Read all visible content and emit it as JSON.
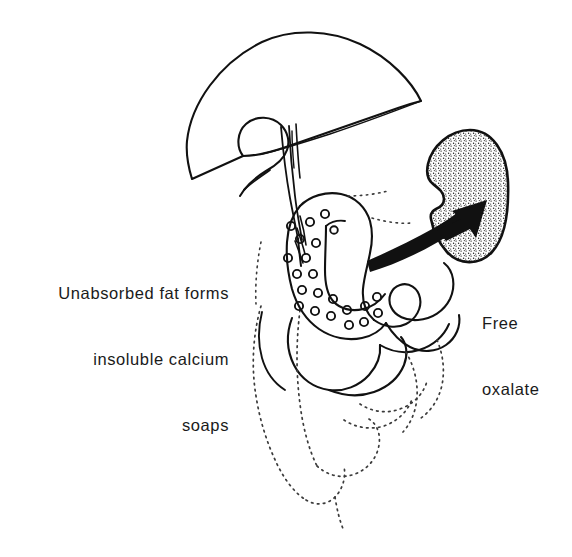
{
  "figure": {
    "domain": "diagram",
    "background_color": "#ffffff",
    "ink_color": "#111111",
    "width": 572,
    "height": 557
  },
  "labels": {
    "left": {
      "name": "unabsorbed-fat-label",
      "align": "right",
      "lines": [
        "Unabsorbed fat forms",
        "insoluble calcium",
        "soaps"
      ]
    },
    "right": {
      "name": "free-oxalate-label",
      "align": "left",
      "lines": [
        "Free",
        "oxalate"
      ]
    }
  },
  "anatomy": [
    {
      "name": "liver",
      "style": "outline",
      "description": "large dome / fan shaped organ occupying the upper portion"
    },
    {
      "name": "gallbladder",
      "style": "outline",
      "description": "small pear shaped sac beneath the liver"
    },
    {
      "name": "bile-duct",
      "style": "outline",
      "description": "ducts descending from gallbladder and liver toward the duodenum"
    },
    {
      "name": "duodenum",
      "style": "outline",
      "description": "C-shaped loop containing stippled fat globules"
    },
    {
      "name": "fat-globules",
      "style": "open-circles",
      "description": "small open circles inside the duodenal loop representing insoluble calcium soaps",
      "count": 22
    },
    {
      "name": "jejunum-loops",
      "style": "outline",
      "description": "serpentine small bowel loops below and right of the duodenum"
    },
    {
      "name": "small-bowel-faded",
      "style": "dotted-outline",
      "description": "faded dotted outlines of further bowel loops trailing to the bottom"
    },
    {
      "name": "kidney",
      "style": "stippled-fill",
      "description": "bean shaped organ at upper right filled with fine stipple texture"
    },
    {
      "name": "oxalate-arrow",
      "style": "solid-black",
      "description": "thick tapered curved arrow pointing from the gut up-right into the kidney"
    }
  ]
}
